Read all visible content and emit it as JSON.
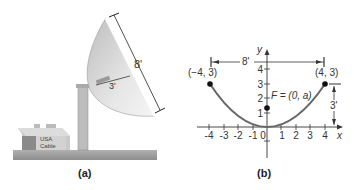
{
  "panel_a": {
    "caption": "(a)",
    "dish_diameter_label": "8'",
    "dish_depth_label": "3'",
    "building_sign_line1": "USA",
    "building_sign_line2": "Cable"
  },
  "panel_b": {
    "caption": "(b)",
    "x_axis_label": "x",
    "y_axis_label": "y",
    "x_ticks": [
      "-4",
      "-3",
      "-2",
      "-1",
      "0",
      "1",
      "2",
      "3",
      "4"
    ],
    "y_ticks": [
      "1",
      "2",
      "3",
      "4"
    ],
    "point_left_label": "(−4, 3)",
    "point_right_label": "(4, 3)",
    "focus_label": "F = (0, a)",
    "width_label": "8'",
    "height_label": "3'"
  },
  "colors": {
    "curve": "#666666",
    "dish": "#cfcfcf",
    "ground": "#9a9a9a",
    "text": "#333333"
  }
}
